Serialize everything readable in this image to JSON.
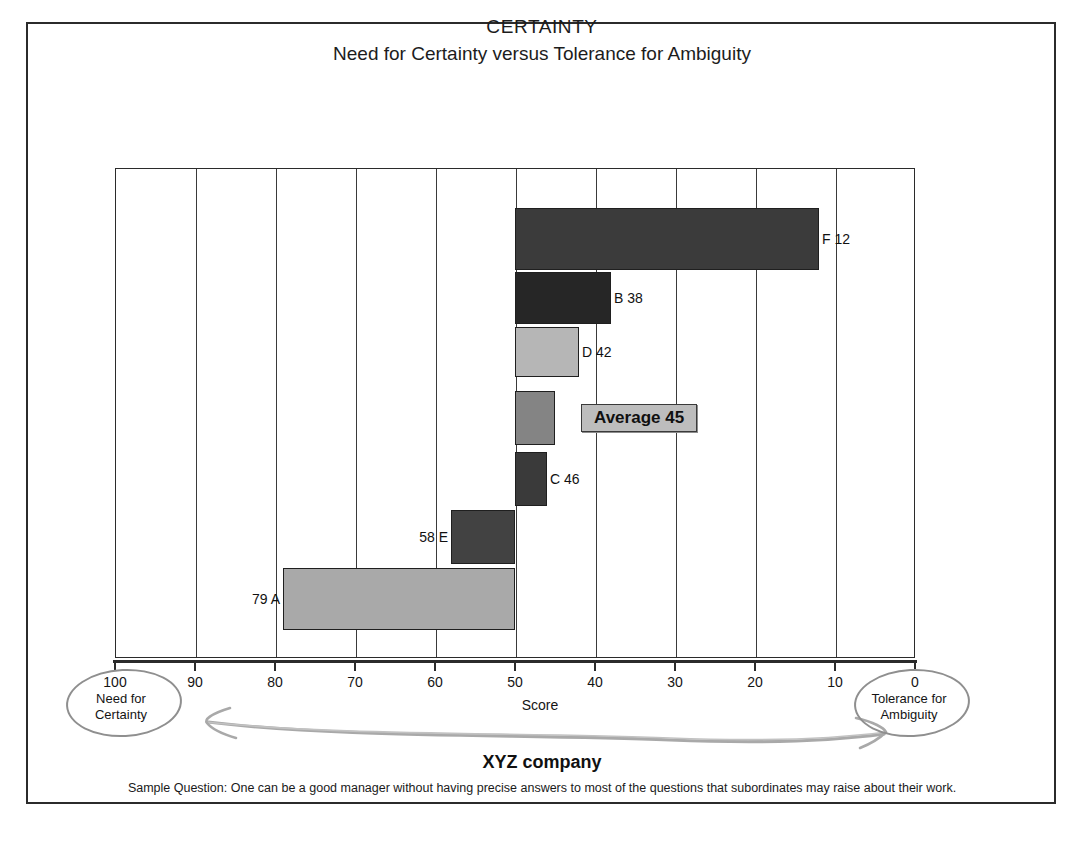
{
  "title": "CERTAINTY",
  "subtitle": "Need for Certainty versus Tolerance for Ambiguity",
  "company": "XYZ company",
  "sample_question": "Sample Question: One can be a good manager without having precise answers to most of the questions that subordinates may raise about their work.",
  "axis": {
    "label": "Score",
    "ticks": [
      "100",
      "90",
      "80",
      "70",
      "60",
      "50",
      "40",
      "30",
      "20",
      "10",
      "0"
    ],
    "left_note_value": "100",
    "left_note_line1": "Need for",
    "left_note_line2": "Certainty",
    "right_note_value": "0",
    "right_note_line1": "Tolerance for",
    "right_note_line2": "Ambiguity"
  },
  "average": {
    "label": "Average 45",
    "value": 45
  },
  "bars": [
    {
      "label": "F 12",
      "name": "F",
      "value": 12,
      "color": "#3b3b3b",
      "label_side": "right"
    },
    {
      "label": "B 38",
      "name": "B",
      "value": 38,
      "color": "#262626",
      "label_side": "right"
    },
    {
      "label": "D 42",
      "name": "D",
      "value": 42,
      "color": "#b6b6b6",
      "label_side": "right"
    },
    {
      "label": "Average 45",
      "name": "Average",
      "value": 45,
      "color": "#848484",
      "label_side": "right"
    },
    {
      "label": "C 46",
      "name": "C",
      "value": 46,
      "color": "#3a3a3a",
      "label_side": "right"
    },
    {
      "label": "58 E",
      "name": "E",
      "value": 58,
      "color": "#424242",
      "label_side": "left"
    },
    {
      "label": "79 A",
      "name": "A",
      "value": 79,
      "color": "#a9a9a9",
      "label_side": "left"
    }
  ],
  "chart_data": {
    "type": "bar",
    "orientation": "horizontal",
    "title": "CERTAINTY",
    "subtitle": "Need for Certainty versus Tolerance for Ambiguity",
    "xlabel": "Score",
    "ylabel": "",
    "xlim": [
      100,
      0
    ],
    "x_axis_reversed": true,
    "baseline": 50,
    "grid": true,
    "legend": false,
    "categories": [
      "F",
      "B",
      "D",
      "Average",
      "C",
      "E",
      "A"
    ],
    "values": [
      12,
      38,
      42,
      45,
      46,
      58,
      79
    ],
    "data_labels": [
      "F 12",
      "B 38",
      "D 42",
      "Average 45",
      "C 46",
      "58 E",
      "79 A"
    ],
    "bar_colors": [
      "#3b3b3b",
      "#262626",
      "#b6b6b6",
      "#848484",
      "#3a3a3a",
      "#424242",
      "#a9a9a9"
    ],
    "xticks": [
      100,
      90,
      80,
      70,
      60,
      50,
      40,
      30,
      20,
      10,
      0
    ],
    "annotations": [
      "100 Need for Certainty",
      "0 Tolerance for Ambiguity",
      "Average 45"
    ],
    "footnote": "Sample Question: One can be a good manager without having precise answers to most of the questions that subordinates may raise about their work."
  }
}
